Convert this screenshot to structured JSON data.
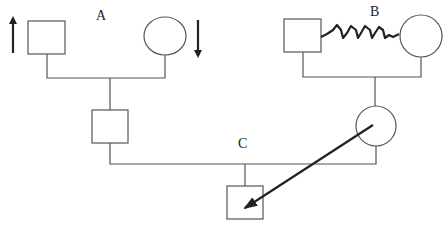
{
  "diagram": {
    "type": "pedigree",
    "labels": {
      "a": "A",
      "b": "B",
      "c": "C"
    },
    "colors": {
      "line": "#555555",
      "arrow": "#222222"
    },
    "nodes": [
      {
        "id": "a-father",
        "shape": "square",
        "group": "A"
      },
      {
        "id": "a-mother",
        "shape": "circle",
        "group": "A"
      },
      {
        "id": "b-father",
        "shape": "square",
        "group": "B"
      },
      {
        "id": "b-mother",
        "shape": "circle",
        "group": "B"
      },
      {
        "id": "a-child",
        "shape": "square",
        "group": "A"
      },
      {
        "id": "b-child",
        "shape": "circle",
        "group": "B"
      },
      {
        "id": "c-child",
        "shape": "square",
        "group": "C"
      }
    ],
    "relations": [
      {
        "from": "a-father",
        "to": "a-mother",
        "type": "mating"
      },
      {
        "from": "b-father",
        "to": "b-mother",
        "type": "zigzag-conflict"
      },
      {
        "from": "a-child",
        "to": "b-child",
        "type": "mating"
      },
      {
        "from": "b-child",
        "to": "c-child",
        "type": "arrow"
      }
    ],
    "annotations": [
      {
        "node": "a-father",
        "arrow": "up"
      },
      {
        "node": "a-mother",
        "arrow": "down"
      }
    ]
  }
}
